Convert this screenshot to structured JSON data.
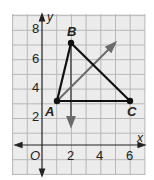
{
  "diagram": {
    "type": "coordinate-plane-triangle",
    "axes": {
      "x_label": "x",
      "y_label": "y",
      "origin_label": "O",
      "x_ticks": [
        "2",
        "4",
        "6"
      ],
      "y_ticks": [
        "2",
        "4",
        "6",
        "8"
      ],
      "x_range": [
        -2,
        7
      ],
      "y_range": [
        -2,
        9
      ],
      "grid": true
    },
    "points": [
      {
        "label": "A",
        "x": 1,
        "y": 3
      },
      {
        "label": "B",
        "x": 2,
        "y": 7
      },
      {
        "label": "C",
        "x": 6,
        "y": 3
      }
    ],
    "segments": [
      [
        "A",
        "B"
      ],
      [
        "B",
        "C"
      ],
      [
        "A",
        "C"
      ]
    ],
    "rays": [
      {
        "from": [
          2,
          7
        ],
        "to": [
          2,
          1.4
        ],
        "description": "vertical ray from B downward"
      },
      {
        "from": [
          1,
          3
        ],
        "to": [
          5,
          7
        ],
        "description": "diagonal ray from A up-right"
      }
    ],
    "colors": {
      "grid_bg": "#ececec",
      "grid_line": "#b8b8b8",
      "triangle": "#111111",
      "ray": "#6b6b6b",
      "axis": "#222222"
    }
  }
}
